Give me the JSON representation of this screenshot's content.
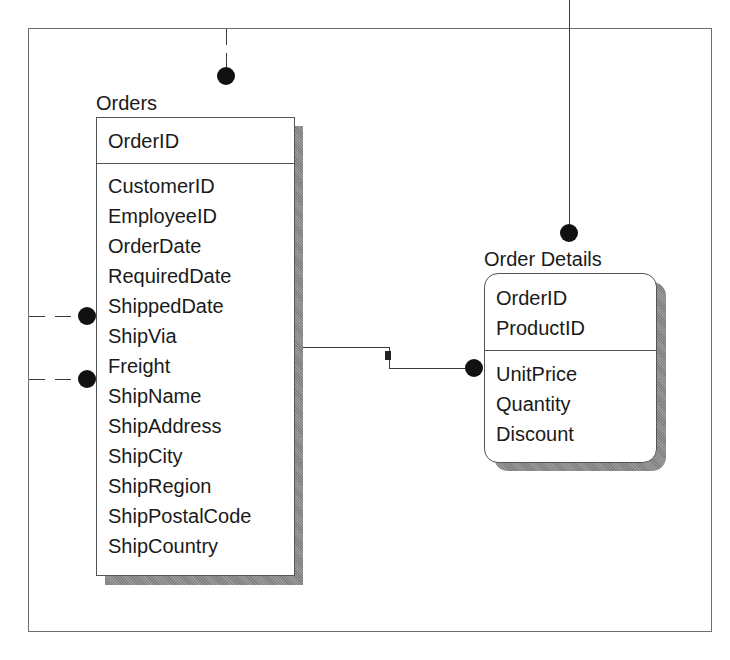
{
  "diagram": {
    "type": "entity-relationship",
    "entities": [
      {
        "name": "Orders",
        "primary_keys": [
          "OrderID"
        ],
        "fields": [
          "CustomerID",
          "EmployeeID",
          "OrderDate",
          "RequiredDate",
          "ShippedDate",
          "ShipVia",
          "Freight",
          "ShipName",
          "ShipAddress",
          "ShipCity",
          "ShipRegion",
          "ShipPostalCode",
          "ShipCountry"
        ]
      },
      {
        "name": "Order Details",
        "primary_keys": [
          "OrderID",
          "ProductID"
        ],
        "fields": [
          "UnitPrice",
          "Quantity",
          "Discount"
        ]
      }
    ],
    "relationships": [
      {
        "from": "Orders",
        "to": "Order Details",
        "style": "solid",
        "end": "many-dot"
      },
      {
        "from": "offscreen-top",
        "to": "Orders",
        "style": "dashed",
        "end": "many-dot"
      },
      {
        "from": "offscreen-left",
        "to": "Orders",
        "style": "dashed",
        "end": "many-dot"
      },
      {
        "from": "offscreen-left",
        "to": "Orders",
        "style": "dashed",
        "end": "many-dot"
      },
      {
        "from": "offscreen-top",
        "to": "Order Details",
        "style": "solid",
        "end": "many-dot"
      }
    ],
    "colors": {
      "line": "#3a3a3a",
      "dot": "#111111",
      "shadow": "#8c8c8c",
      "border": "#555555"
    }
  }
}
